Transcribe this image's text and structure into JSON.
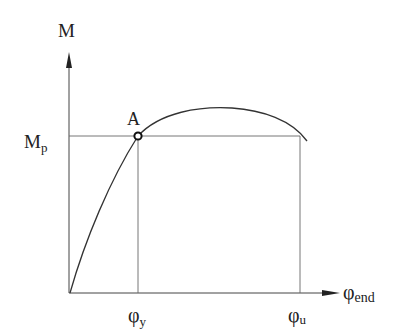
{
  "diagram": {
    "type": "moment-curvature",
    "y_axis_label": "M",
    "x_axis_label_main": "φ",
    "x_axis_label_sub": "end",
    "yield_moment_label_main": "M",
    "yield_moment_label_sub": "p",
    "point_label": "A",
    "phi_y_main": "φ",
    "phi_y_sub": "y",
    "phi_u_main": "φ",
    "phi_u_sub": "u",
    "colors": {
      "line": "#333333",
      "guide": "#555555",
      "background": "#ffffff"
    }
  }
}
